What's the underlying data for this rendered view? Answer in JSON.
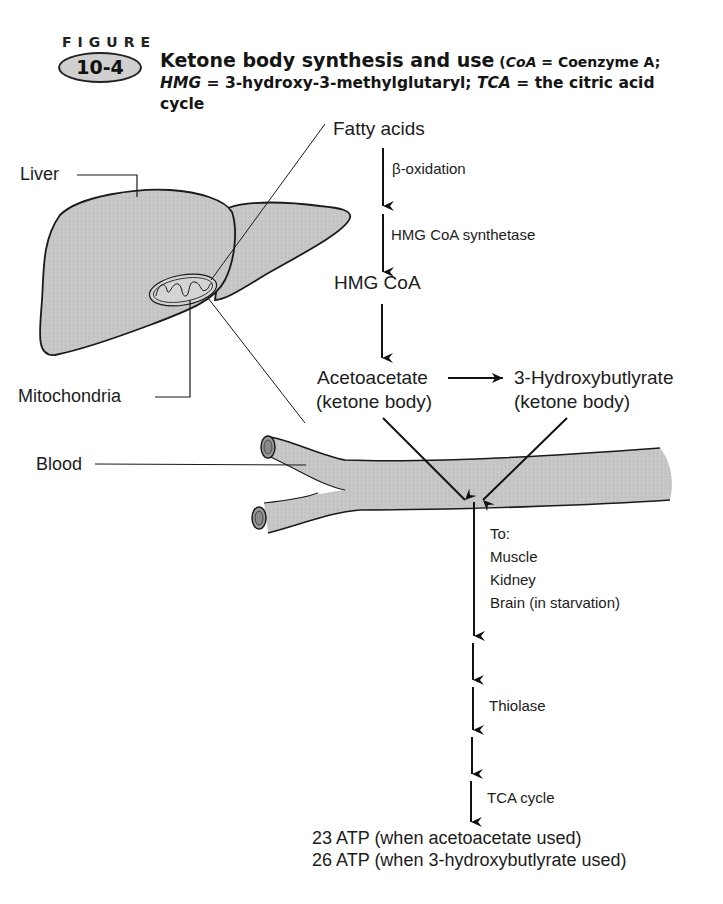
{
  "figure": {
    "label": "FIGURE",
    "number": "10-4",
    "title": {
      "main": "Ketone body synthesis and use",
      "abbr_open": " (",
      "coa_abbr": "CoA",
      "coa_def": " = Coenzyme A;",
      "hmg_abbr": "HMG",
      "hmg_def": " = 3-hydroxy-3-methylglutaryl; ",
      "tca_abbr": "TCA",
      "tca_def": " = the citric acid cycle"
    }
  },
  "anatomy_labels": {
    "liver": "Liver",
    "mitochondria": "Mitochondria",
    "blood": "Blood"
  },
  "pathway": {
    "fatty_acids": "Fatty acids",
    "step1_enzyme": "β-oxidation",
    "step2_enzyme": "HMG CoA synthetase",
    "hmg_coa": "HMG CoA",
    "acetoacetate": "Acetoacetate",
    "acetoacetate_note": "(ketone body)",
    "hydroxybutyrate": "3-Hydroxybutlyrate",
    "hydroxybutyrate_note": "(ketone body)",
    "destinations_header": "To:",
    "destinations": [
      "Muscle",
      "Kidney",
      "Brain (in starvation)"
    ],
    "thiolase": "Thiolase",
    "tca": "TCA cycle",
    "atp_yields": [
      "23 ATP (when acetoacetate used)",
      "26 ATP (when 3-hydroxybutlyrate used)"
    ]
  },
  "colors": {
    "organ_fill": "#c4c4c4",
    "line": "#1a1a1a",
    "background": "#ffffff"
  }
}
